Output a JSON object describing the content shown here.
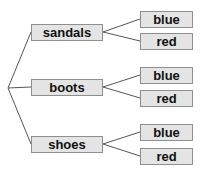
{
  "diagram": {
    "type": "tree",
    "root": {
      "x": 8,
      "y": 88
    },
    "branches": [
      {
        "label": "sandals",
        "y": 24,
        "leaves": [
          {
            "label": "blue",
            "y": 11
          },
          {
            "label": "red",
            "y": 33
          }
        ]
      },
      {
        "label": "boots",
        "y": 79,
        "leaves": [
          {
            "label": "blue",
            "y": 67
          },
          {
            "label": "red",
            "y": 90
          }
        ]
      },
      {
        "label": "shoes",
        "y": 136,
        "leaves": [
          {
            "label": "blue",
            "y": 124
          },
          {
            "label": "red",
            "y": 148
          }
        ]
      }
    ],
    "colors": {
      "box_fill": "#e4e4e4",
      "box_border": "#8f8f8f",
      "line": "#555555",
      "text": "#111111"
    }
  }
}
